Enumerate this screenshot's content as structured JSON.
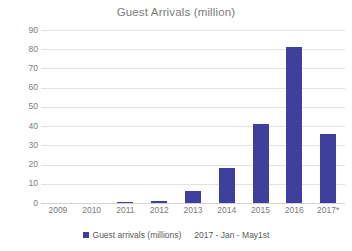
{
  "chart_data": {
    "type": "bar",
    "title": "Guest Arrivals (million)",
    "xlabel": "",
    "ylabel": "",
    "categories": [
      "2009",
      "2010",
      "2011",
      "2012",
      "2013",
      "2014",
      "2015",
      "2016",
      "2017*"
    ],
    "values": [
      0,
      0,
      0.5,
      1,
      6.5,
      18,
      41,
      81,
      36
    ],
    "series": [
      {
        "name": "Guest arrivals (millions)",
        "values": [
          0,
          0,
          0.5,
          1,
          6.5,
          18,
          41,
          81,
          36
        ],
        "color": "#3f3f9e"
      }
    ],
    "ylim": [
      0,
      90
    ],
    "yticks": [
      0,
      10,
      20,
      30,
      40,
      50,
      60,
      70,
      80,
      90
    ],
    "ytick_labels": [
      "0",
      "10",
      "20",
      "30",
      "40",
      "50",
      "60",
      "70",
      "80",
      "90"
    ],
    "grid": true,
    "legend_position": "bottom",
    "annotations": [
      "2017 - Jan - May1st"
    ]
  },
  "legend": {
    "series_label": "Guest arrivals (millions)",
    "note": "2017 - Jan - May1st",
    "swatch_color": "#3f3f9e"
  },
  "colors": {
    "bar": "#3f3f9e",
    "gridline": "#e2e2e2",
    "text": "#7b7b7b",
    "background": "#ffffff"
  }
}
